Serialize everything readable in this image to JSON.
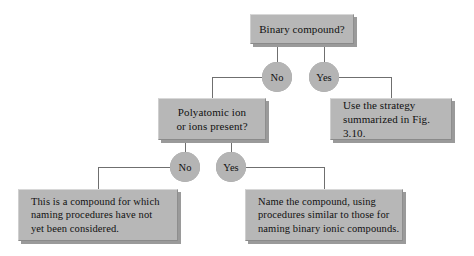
{
  "diagram": {
    "colors": {
      "background": "#ffffff",
      "box_fill": "#b7b7b7",
      "box_shadow": "#9a9a9a",
      "bubble_fill": "#b4b4b4",
      "line": "#6f6f6f",
      "text": "#111111"
    },
    "nodes": {
      "root": {
        "id": "binary-compound-question",
        "text": "Binary compound?",
        "x": 250,
        "y": 14,
        "w": 104,
        "h": 30,
        "font_size": 11,
        "align": "center"
      },
      "polyatomic": {
        "id": "polyatomic-ion-question",
        "text": "Polyatomic ion\nor ions present?",
        "x": 158,
        "y": 98,
        "w": 108,
        "h": 42,
        "font_size": 11,
        "align": "center"
      },
      "strategy": {
        "id": "use-strategy-result",
        "text": "Use the strategy\nsummarized in Fig. 3.10.",
        "x": 330,
        "y": 98,
        "w": 122,
        "h": 42,
        "font_size": 11,
        "align": "left"
      },
      "not_considered": {
        "id": "not-considered-result",
        "text": "This is a compound for which\nnaming procedures have not\nyet been considered.",
        "x": 18,
        "y": 189,
        "w": 160,
        "h": 52,
        "font_size": 10.5,
        "align": "left"
      },
      "name_compound": {
        "id": "name-compound-result",
        "text": "Name the compound, using\nprocedures similar to those for\nnaming binary ionic compounds.",
        "x": 245,
        "y": 189,
        "w": 158,
        "h": 52,
        "font_size": 10.5,
        "align": "left"
      }
    },
    "bubbles": {
      "top_no": {
        "label": "No",
        "x": 262,
        "y": 62
      },
      "top_yes": {
        "label": "Yes",
        "x": 309,
        "y": 62
      },
      "mid_no": {
        "label": "No",
        "x": 170,
        "y": 152
      },
      "mid_yes": {
        "label": "Yes",
        "x": 216,
        "y": 152
      }
    }
  }
}
